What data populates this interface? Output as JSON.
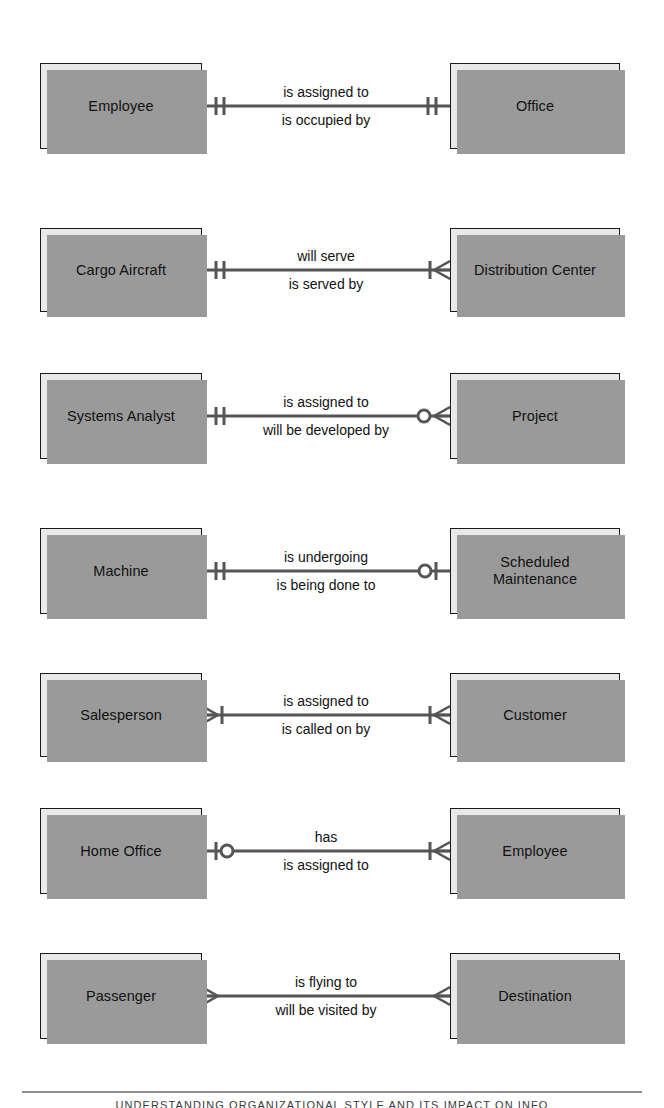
{
  "diagram": {
    "notation": "crow's foot",
    "box_fill_color": "#e9e9e9",
    "box_border_color": "#1a1a1a",
    "shadow_color": "#9a9a9a",
    "line_color": "#555555",
    "rows": [
      {
        "left_entity": "Employee",
        "right_entity": "Office",
        "verb_top": "is assigned to",
        "verb_bottom": "is occupied by",
        "left_cardinality": "one-and-only-one",
        "right_cardinality": "one-and-only-one"
      },
      {
        "left_entity": "Cargo Aircraft",
        "right_entity": "Distribution Center",
        "verb_top": "will serve",
        "verb_bottom": "is served by",
        "left_cardinality": "one-and-only-one",
        "right_cardinality": "one-or-many"
      },
      {
        "left_entity": "Systems Analyst",
        "right_entity": "Project",
        "verb_top": "is assigned to",
        "verb_bottom": "will be developed by",
        "left_cardinality": "one-and-only-one",
        "right_cardinality": "zero-or-many"
      },
      {
        "left_entity": "Machine",
        "right_entity": "Scheduled\nMaintenance",
        "verb_top": "is undergoing",
        "verb_bottom": "is being done to",
        "left_cardinality": "one-and-only-one",
        "right_cardinality": "zero-or-one"
      },
      {
        "left_entity": "Salesperson",
        "right_entity": "Customer",
        "verb_top": "is assigned to",
        "verb_bottom": "is called on by",
        "left_cardinality": "one-or-many",
        "right_cardinality": "one-or-many"
      },
      {
        "left_entity": "Home Office",
        "right_entity": "Employee",
        "verb_top": "has",
        "verb_bottom": "is assigned to",
        "left_cardinality": "zero-or-one",
        "right_cardinality": "one-or-many"
      },
      {
        "left_entity": "Passenger",
        "right_entity": "Destination",
        "verb_top": "is flying to",
        "verb_bottom": "will be visited by",
        "left_cardinality": "many",
        "right_cardinality": "many"
      }
    ]
  },
  "footer": {
    "text": "UNDERSTANDING ORGANIZATIONAL STYLE AND ITS IMPACT ON INFO"
  }
}
